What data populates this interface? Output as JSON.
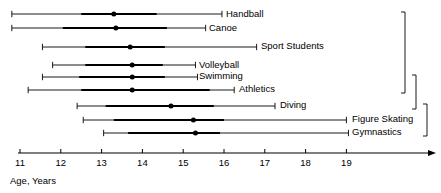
{
  "chart_data": {
    "type": "bar",
    "title": "",
    "subtitle": "",
    "xlabel": "Age, Years",
    "ylabel": "",
    "xlim": [
      10.7,
      21.2
    ],
    "grid": false,
    "legend": "none",
    "orientation": "horizontal",
    "axis": {
      "tick_labels": [
        "11",
        "12",
        "13",
        "14",
        "15",
        "16",
        "17",
        "18",
        "19"
      ],
      "tick_values": [
        11,
        12,
        13,
        14,
        15,
        16,
        17,
        18,
        19
      ],
      "label": "Age, Years",
      "arrow_end": true
    },
    "categories": [
      "Handball",
      "Canoe",
      "Sport Students",
      "Volleyball",
      "Swimming",
      "Athletics",
      "Diving",
      "Figure Skating",
      "Gymnastics"
    ],
    "series": [
      {
        "name": "range_min",
        "values": [
          10.8,
          10.8,
          11.55,
          11.8,
          11.55,
          11.2,
          12.4,
          12.55,
          13.05
        ]
      },
      {
        "name": "band_min",
        "values": [
          12.5,
          12.05,
          12.6,
          12.6,
          12.45,
          12.5,
          13.1,
          13.3,
          13.65
        ]
      },
      {
        "name": "median",
        "values": [
          13.3,
          13.35,
          13.7,
          13.75,
          13.75,
          13.75,
          14.7,
          15.25,
          15.3
        ]
      },
      {
        "name": "band_max",
        "values": [
          14.35,
          14.6,
          14.55,
          14.5,
          14.55,
          15.65,
          15.75,
          16.0,
          15.9
        ]
      },
      {
        "name": "range_max",
        "values": [
          15.95,
          15.55,
          16.8,
          15.3,
          15.35,
          16.25,
          17.25,
          19.0,
          19.05
        ]
      }
    ],
    "brackets": [
      {
        "label": "",
        "from_category": "Handball",
        "to_category": "Athletics"
      },
      {
        "label": "",
        "from_category": "Swimming",
        "to_category": "Diving"
      },
      {
        "label": "",
        "from_category": "Diving",
        "to_category": "Gymnastics"
      }
    ]
  },
  "rows": [
    {
      "label": "Handball"
    },
    {
      "label": "Canoe"
    },
    {
      "label": "Sport Students"
    },
    {
      "label": "Volleyball"
    },
    {
      "label": "Swimming"
    },
    {
      "label": "Athletics"
    },
    {
      "label": "Diving"
    },
    {
      "label": "Figure Skating"
    },
    {
      "label": "Gymnastics"
    }
  ],
  "axis_title": "Age, Years",
  "ticks": [
    "11",
    "12",
    "13",
    "14",
    "15",
    "16",
    "17",
    "18",
    "19"
  ],
  "colors": {
    "ink": "#000000",
    "background": "#ffffff"
  }
}
